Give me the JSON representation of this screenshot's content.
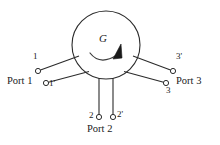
{
  "figure": {
    "device_symbol": "G",
    "rotation_indicator": "clockwise-curved-arrow",
    "stroke_color": "#2b2b2b",
    "background_color": "#ffffff",
    "body": {
      "shape": "circle",
      "center_x": 106,
      "center_y": 45,
      "radius": 34
    },
    "ports": [
      {
        "id": "port-1",
        "label": "Port 1",
        "label_x": 7,
        "label_y": 77,
        "terminals": [
          {
            "id": "terminal-1",
            "label": "1",
            "label_x": 33,
            "label_y": 58,
            "node_x": 38,
            "node_y": 71,
            "attach_x": 79,
            "attach_y": 56
          },
          {
            "id": "terminal-1-prime",
            "label": "1'",
            "label_x": 49,
            "label_y": 79,
            "node_x": 46,
            "node_y": 83,
            "attach_x": 89,
            "attach_y": 71
          }
        ]
      },
      {
        "id": "port-2",
        "label": "Port 2",
        "label_x": 89,
        "label_y": 128,
        "terminals": [
          {
            "id": "terminal-2",
            "label": "2",
            "label_x": 89,
            "label_y": 113,
            "node_x": 99,
            "node_y": 117,
            "attach_x": 99,
            "attach_y": 77
          },
          {
            "id": "terminal-2-prime",
            "label": "2'",
            "label_x": 117,
            "label_y": 112,
            "node_x": 113,
            "node_y": 117,
            "attach_x": 113,
            "attach_y": 77
          }
        ]
      },
      {
        "id": "port-3",
        "label": "Port 3",
        "label_x": 178,
        "label_y": 77,
        "terminals": [
          {
            "id": "terminal-3-prime",
            "label": "3'",
            "label_x": 176,
            "label_y": 58,
            "node_x": 173,
            "node_y": 71,
            "attach_x": 133,
            "attach_y": 56
          },
          {
            "id": "terminal-3",
            "label": "3",
            "label_x": 168,
            "label_y": 88,
            "node_x": 166,
            "node_y": 83,
            "attach_x": 124,
            "attach_y": 71
          }
        ]
      }
    ]
  }
}
